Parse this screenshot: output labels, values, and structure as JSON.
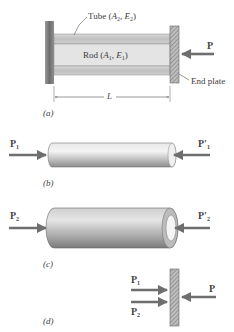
{
  "figure": {
    "panel_a": {
      "caption": "(a)",
      "tube_label": "Tube (",
      "tube_params": [
        "A",
        "2",
        "E",
        "2"
      ],
      "rod_label": "Rod (",
      "rod_params": [
        "A",
        "1",
        "E",
        "1"
      ],
      "end_plate_label": "End plate",
      "load_label": "P",
      "length_label": "L"
    },
    "panel_b": {
      "caption": "(b)",
      "left_force": {
        "base": "P",
        "sub": "1"
      },
      "right_force": {
        "base": "P'",
        "sub": "1"
      }
    },
    "panel_c": {
      "caption": "(c)",
      "left_force": {
        "base": "P",
        "sub": "2"
      },
      "right_force": {
        "base": "P'",
        "sub": "2"
      }
    },
    "panel_d": {
      "caption": "(d)",
      "force_1": {
        "base": "P",
        "sub": "1"
      },
      "force_2": {
        "base": "P",
        "sub": "2"
      },
      "load_label": "P"
    }
  },
  "colors": {
    "arrow": "#6e6e6e",
    "wall": "#8c8c8c",
    "tube": "#c9c9c9",
    "rod": "#e6e6e6",
    "hatch": "#7a7a7a"
  }
}
